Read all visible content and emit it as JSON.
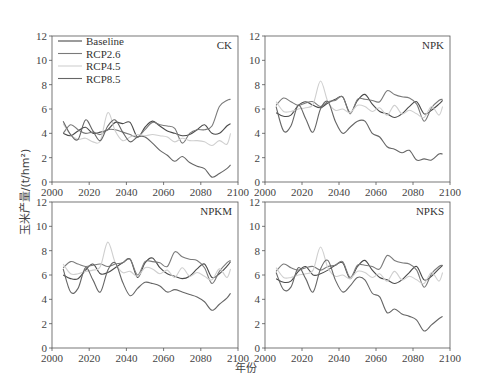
{
  "chart_data": [
    {
      "type": "line",
      "title": "CK",
      "xlabel": "年份",
      "ylabel": "玉米产量/(t/hm²)",
      "xlim": [
        2000,
        2100
      ],
      "ylim": [
        0,
        12
      ],
      "xticks": [
        2000,
        2020,
        2040,
        2060,
        2080,
        2100
      ],
      "yticks": [
        0,
        2,
        4,
        6,
        8,
        10,
        12
      ],
      "legend": [
        "Baseline",
        "RCP2.6",
        "RCP4.5",
        "RCP8.5"
      ],
      "legend_position": "upper left",
      "grid": false,
      "x": [
        2006,
        2010,
        2014,
        2018,
        2022,
        2026,
        2030,
        2034,
        2038,
        2042,
        2046,
        2050,
        2054,
        2058,
        2062,
        2066,
        2070,
        2074,
        2078,
        2082,
        2086,
        2090,
        2094,
        2096
      ],
      "series": [
        {
          "name": "Baseline",
          "color": "#4a4a4a",
          "values": [
            4.0,
            3.8,
            4.2,
            4.5,
            4.0,
            4.1,
            4.3,
            4.9,
            4.8,
            4.9,
            3.7,
            4.5,
            5.0,
            4.6,
            4.2,
            4.0,
            3.8,
            3.9,
            4.3,
            4.7,
            4.0,
            4.0,
            4.6,
            4.8
          ]
        },
        {
          "name": "RCP2.6",
          "color": "#7a7a7a",
          "values": [
            4.0,
            4.7,
            4.3,
            4.0,
            4.1,
            3.9,
            4.3,
            4.3,
            4.1,
            3.9,
            3.7,
            4.3,
            4.9,
            4.7,
            4.6,
            4.4,
            3.2,
            4.0,
            4.3,
            4.3,
            4.6,
            6.2,
            6.7,
            6.8
          ]
        },
        {
          "name": "RCP4.5",
          "color": "#cfcfcf",
          "values": [
            4.8,
            3.9,
            3.5,
            3.6,
            3.3,
            3.4,
            5.7,
            4.2,
            3.4,
            3.7,
            3.9,
            3.8,
            3.9,
            3.8,
            3.7,
            3.3,
            3.6,
            3.4,
            3.4,
            3.3,
            3.0,
            3.4,
            3.1,
            4.0
          ]
        },
        {
          "name": "RCP8.5",
          "color": "#666666",
          "values": [
            5.0,
            3.9,
            3.5,
            5.1,
            4.2,
            3.4,
            4.6,
            5.1,
            4.1,
            3.3,
            3.7,
            3.7,
            3.2,
            2.6,
            2.2,
            1.7,
            2.1,
            1.6,
            1.3,
            1.1,
            0.4,
            0.7,
            1.1,
            1.4
          ]
        }
      ]
    },
    {
      "type": "line",
      "title": "NPK",
      "xlim": [
        2000,
        2100
      ],
      "ylim": [
        0,
        12
      ],
      "xticks": [
        2000,
        2020,
        2040,
        2060,
        2080,
        2100
      ],
      "yticks": [
        0,
        2,
        4,
        6,
        8,
        10,
        12
      ],
      "x": [
        2006,
        2010,
        2014,
        2018,
        2022,
        2026,
        2030,
        2034,
        2038,
        2042,
        2046,
        2050,
        2054,
        2058,
        2062,
        2066,
        2070,
        2074,
        2078,
        2082,
        2086,
        2090,
        2094,
        2096
      ],
      "series": [
        {
          "name": "Baseline",
          "color": "#4a4a4a",
          "values": [
            5.7,
            5.4,
            5.5,
            6.3,
            6.6,
            6.3,
            6.1,
            6.5,
            6.8,
            7.0,
            5.7,
            6.7,
            7.2,
            6.4,
            5.8,
            5.6,
            5.3,
            5.6,
            6.2,
            6.6,
            5.6,
            5.9,
            6.4,
            6.7
          ]
        },
        {
          "name": "RCP2.6",
          "color": "#7a7a7a",
          "values": [
            6.3,
            6.9,
            6.6,
            6.3,
            6.5,
            6.6,
            6.2,
            6.6,
            6.7,
            7.0,
            5.6,
            6.8,
            6.8,
            6.7,
            6.6,
            7.5,
            7.2,
            7.0,
            6.9,
            6.4,
            5.0,
            6.1,
            6.7,
            6.8
          ]
        },
        {
          "name": "RCP4.5",
          "color": "#cfcfcf",
          "values": [
            6.6,
            5.8,
            5.8,
            6.0,
            6.1,
            6.4,
            8.3,
            6.6,
            5.9,
            6.0,
            5.7,
            6.3,
            6.2,
            5.8,
            6.1,
            5.5,
            6.3,
            5.6,
            5.9,
            5.6,
            5.3,
            6.2,
            5.5,
            6.2
          ]
        },
        {
          "name": "RCP8.5",
          "color": "#666666",
          "values": [
            6.2,
            4.2,
            4.6,
            6.3,
            5.2,
            4.1,
            6.0,
            6.6,
            5.0,
            4.0,
            4.5,
            5.0,
            5.0,
            4.0,
            3.7,
            2.9,
            2.7,
            2.4,
            2.6,
            1.8,
            1.9,
            1.8,
            2.3,
            2.3
          ]
        }
      ]
    },
    {
      "type": "line",
      "title": "NPKM",
      "xlim": [
        2000,
        2100
      ],
      "ylim": [
        0,
        12
      ],
      "xticks": [
        2000,
        2020,
        2040,
        2060,
        2080,
        2100
      ],
      "yticks": [
        0,
        2,
        4,
        6,
        8,
        10,
        12
      ],
      "x": [
        2006,
        2010,
        2014,
        2018,
        2022,
        2026,
        2030,
        2034,
        2038,
        2042,
        2046,
        2050,
        2054,
        2058,
        2062,
        2066,
        2070,
        2074,
        2078,
        2082,
        2086,
        2090,
        2094,
        2096
      ],
      "series": [
        {
          "name": "Baseline",
          "color": "#4a4a4a",
          "values": [
            6.0,
            5.7,
            5.7,
            6.4,
            6.9,
            6.1,
            6.2,
            6.6,
            7.0,
            7.3,
            5.8,
            7.0,
            7.4,
            6.6,
            6.1,
            5.9,
            5.7,
            5.9,
            6.5,
            6.9,
            5.8,
            6.1,
            6.7,
            7.1
          ]
        },
        {
          "name": "RCP2.6",
          "color": "#7a7a7a",
          "values": [
            6.6,
            7.1,
            6.9,
            6.7,
            6.8,
            6.9,
            6.7,
            6.9,
            7.0,
            7.3,
            6.0,
            7.1,
            7.1,
            7.0,
            6.7,
            7.9,
            7.5,
            7.3,
            7.2,
            6.6,
            5.3,
            6.3,
            7.0,
            7.2
          ]
        },
        {
          "name": "RCP4.5",
          "color": "#cfcfcf",
          "values": [
            6.9,
            6.1,
            6.1,
            6.3,
            6.4,
            6.7,
            8.7,
            7.0,
            6.2,
            6.3,
            5.9,
            6.6,
            6.5,
            6.1,
            6.4,
            5.8,
            6.6,
            5.9,
            6.2,
            5.9,
            5.6,
            6.5,
            5.8,
            6.5
          ]
        },
        {
          "name": "RCP8.5",
          "color": "#666666",
          "values": [
            6.5,
            4.6,
            4.9,
            6.6,
            5.6,
            4.6,
            6.4,
            7.0,
            5.4,
            4.3,
            4.9,
            5.4,
            5.3,
            5.1,
            4.6,
            4.8,
            4.6,
            4.4,
            4.2,
            3.8,
            3.1,
            3.6,
            4.1,
            4.5
          ]
        }
      ]
    },
    {
      "type": "line",
      "title": "NPKS",
      "xlim": [
        2000,
        2100
      ],
      "ylim": [
        0,
        12
      ],
      "xticks": [
        2000,
        2020,
        2040,
        2060,
        2080,
        2100
      ],
      "yticks": [
        0,
        2,
        4,
        6,
        8,
        10,
        12
      ],
      "x": [
        2006,
        2010,
        2014,
        2018,
        2022,
        2026,
        2030,
        2034,
        2038,
        2042,
        2046,
        2050,
        2054,
        2058,
        2062,
        2066,
        2070,
        2074,
        2078,
        2082,
        2086,
        2090,
        2094,
        2096
      ],
      "series": [
        {
          "name": "Baseline",
          "color": "#4a4a4a",
          "values": [
            5.7,
            5.4,
            5.5,
            6.3,
            6.7,
            6.0,
            6.1,
            6.4,
            6.8,
            7.0,
            5.7,
            6.7,
            7.2,
            6.4,
            5.8,
            5.6,
            5.3,
            5.6,
            6.2,
            6.7,
            5.6,
            5.9,
            6.5,
            6.8
          ]
        },
        {
          "name": "RCP2.6",
          "color": "#7a7a7a",
          "values": [
            6.3,
            6.9,
            6.6,
            6.4,
            6.6,
            6.7,
            6.4,
            6.7,
            6.8,
            7.1,
            5.8,
            6.8,
            6.8,
            6.7,
            6.5,
            7.6,
            7.2,
            7.0,
            6.9,
            6.4,
            5.0,
            6.1,
            6.7,
            6.8
          ]
        },
        {
          "name": "RCP4.5",
          "color": "#cfcfcf",
          "values": [
            6.6,
            5.8,
            5.8,
            6.0,
            6.1,
            6.4,
            8.3,
            6.6,
            5.9,
            6.0,
            5.7,
            6.3,
            6.2,
            5.8,
            6.1,
            5.5,
            6.3,
            5.6,
            5.9,
            5.6,
            5.3,
            6.2,
            5.5,
            6.2
          ]
        },
        {
          "name": "RCP8.5",
          "color": "#666666",
          "values": [
            6.2,
            4.8,
            5.0,
            6.6,
            5.7,
            4.6,
            6.5,
            7.2,
            5.6,
            4.6,
            5.1,
            5.8,
            5.6,
            4.5,
            4.2,
            2.9,
            3.2,
            2.8,
            2.6,
            2.3,
            1.4,
            1.9,
            2.4,
            2.6
          ]
        }
      ]
    }
  ],
  "figure": {
    "ylabel": "玉米产量/(t/hm²)",
    "xlabel": "年份"
  }
}
